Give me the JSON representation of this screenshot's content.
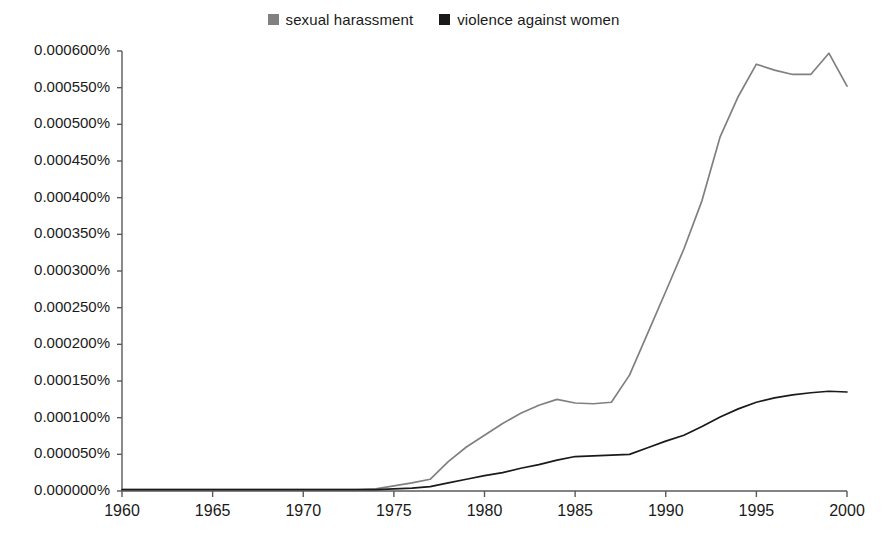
{
  "legend": {
    "position": "top-center",
    "entries": [
      {
        "label": "sexual harassment",
        "color": "#808080",
        "swatch": "legend-swatch-gray"
      },
      {
        "label": "violence against women",
        "color": "#1a1a1a",
        "swatch": "legend-swatch-black"
      }
    ]
  },
  "axes": {
    "y_ticks": [
      "0.000600%",
      "0.000550%",
      "0.000500%",
      "0.000450%",
      "0.000400%",
      "0.000350%",
      "0.000300%",
      "0.000250%",
      "0.000200%",
      "0.000150%",
      "0.000100%",
      "0.000050%",
      "0.000000%"
    ],
    "x_ticks": [
      "1960",
      "1965",
      "1970",
      "1975",
      "1980",
      "1985",
      "1990",
      "1995",
      "2000"
    ]
  },
  "chart_data": {
    "type": "line",
    "title": "",
    "subtitle": "",
    "xlabel": "",
    "ylabel": "",
    "xlim": [
      1960,
      2000
    ],
    "ylim": [
      0.0,
      0.0006
    ],
    "y_unit": "percent",
    "y_tick_step": 5e-05,
    "x_tick_step": 5,
    "grid": false,
    "legend_position": "top-center",
    "x": [
      1960,
      1961,
      1962,
      1963,
      1964,
      1965,
      1966,
      1967,
      1968,
      1969,
      1970,
      1971,
      1972,
      1973,
      1974,
      1975,
      1976,
      1977,
      1978,
      1979,
      1980,
      1981,
      1982,
      1983,
      1984,
      1985,
      1986,
      1987,
      1988,
      1989,
      1990,
      1991,
      1992,
      1993,
      1994,
      1995,
      1996,
      1997,
      1998,
      1999,
      2000
    ],
    "series": [
      {
        "name": "sexual harassment",
        "color": "#808080",
        "values": [
          2e-06,
          2e-06,
          2e-06,
          2e-06,
          2e-06,
          2e-06,
          2e-06,
          2e-06,
          2e-06,
          2e-06,
          2e-06,
          2e-06,
          2e-06,
          2e-06,
          3e-06,
          7e-06,
          1.1e-05,
          1.6e-05,
          4e-05,
          6e-05,
          7.6e-05,
          9.2e-05,
          0.000106,
          0.000117,
          0.000125,
          0.00012,
          0.000119,
          0.000121,
          0.000158,
          0.000215,
          0.000272,
          0.00033,
          0.000396,
          0.000483,
          0.000538,
          0.000582,
          0.000574,
          0.000568,
          0.000568,
          0.000597,
          0.000552
        ]
      },
      {
        "name": "violence against women",
        "color": "#1a1a1a",
        "values": [
          2e-06,
          2e-06,
          2e-06,
          2e-06,
          2e-06,
          2e-06,
          2e-06,
          2e-06,
          2e-06,
          2e-06,
          2e-06,
          2e-06,
          2e-06,
          2e-06,
          2e-06,
          3e-06,
          4e-06,
          6e-06,
          1.1e-05,
          1.6e-05,
          2.1e-05,
          2.5e-05,
          3.1e-05,
          3.6e-05,
          4.2e-05,
          4.7e-05,
          4.8e-05,
          4.9e-05,
          5e-05,
          5.9e-05,
          6.8e-05,
          7.6e-05,
          8.8e-05,
          0.000101,
          0.000112,
          0.000121,
          0.000127,
          0.000131,
          0.000134,
          0.000136,
          0.000135
        ]
      }
    ]
  }
}
